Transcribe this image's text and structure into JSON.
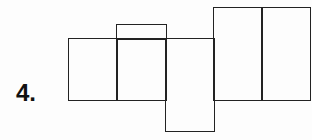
{
  "problem": {
    "number_label": "4.",
    "figure": "net of rectangular prism (6 rectangles)"
  }
}
